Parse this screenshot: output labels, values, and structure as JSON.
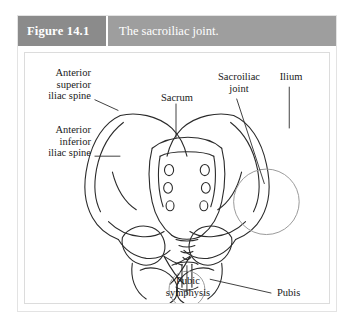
{
  "figure": {
    "number_label": "Figure 14.1",
    "caption": "The sacroiliac joint.",
    "number_block_color": "#8b8b8b",
    "caption_block_color": "#9e9e9e",
    "panel_background": "#ffffff",
    "line_color": "#2b2b2b",
    "highlight_circle_color": "#9a9a9a"
  },
  "labels": {
    "anterior_superior_iliac_spine": "Anterior\nsuperior\niliac spine",
    "anterior_inferior_iliac_spine": "Anterior\ninferior\niliac spine",
    "sacrum": "Sacrum",
    "sacroiliac_joint": "Sacroiliac\njoint",
    "ilium": "Ilium",
    "pubic_symphysis": "Pubic\nsymphysis",
    "pubis": "Pubis"
  },
  "illustration": {
    "subject": "anterior view of the bony pelvis",
    "highlighted_structures": [
      "sacroiliac joint",
      "pubic symphysis"
    ],
    "depicted_parts": [
      "right ilium",
      "left ilium",
      "iliac crest",
      "sacrum",
      "sacral foramina",
      "coccyx",
      "pubic symphysis",
      "obturator foramen",
      "ischium",
      "acetabulum"
    ]
  }
}
